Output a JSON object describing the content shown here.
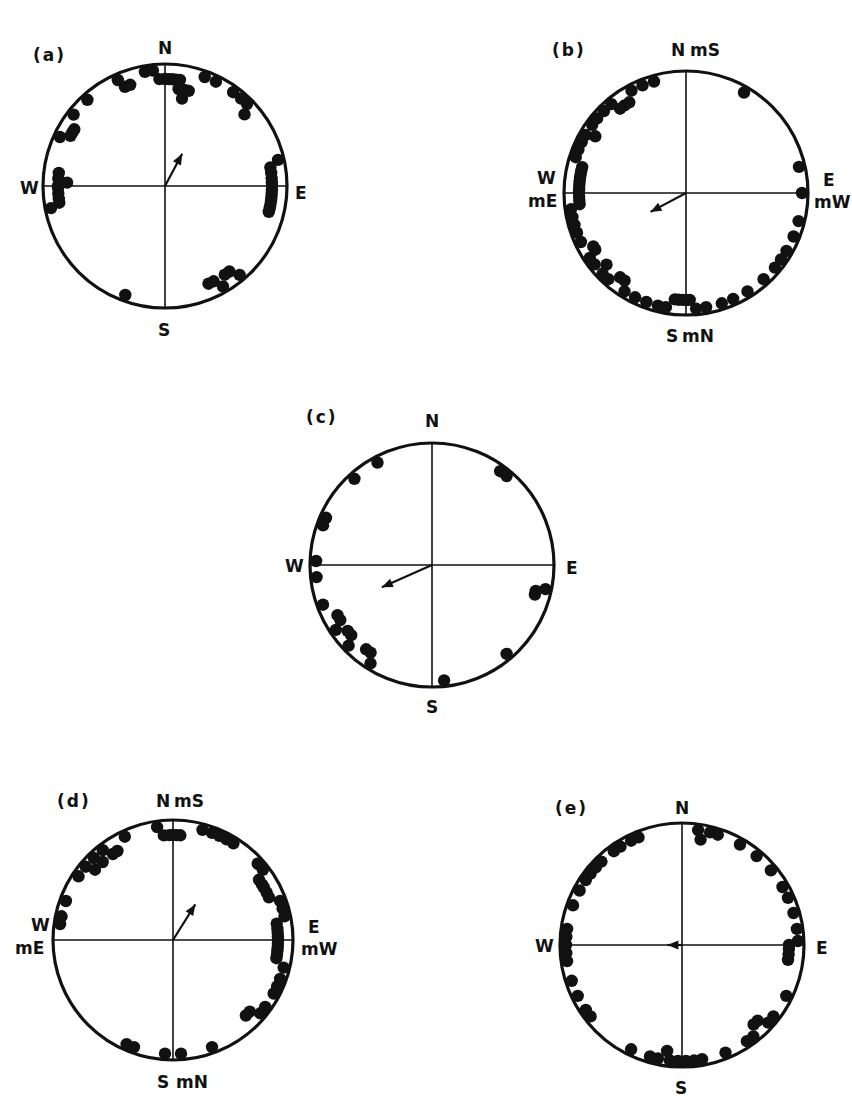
{
  "figure": {
    "panels": [
      {
        "id": "a",
        "label": "(a)",
        "north": "N",
        "south": "S",
        "west": "W",
        "east": "E",
        "north2": "",
        "south2": "",
        "west2": "",
        "east2": "",
        "center": [
          165,
          186
        ],
        "radius": 122,
        "label_pos": [
          33,
          47
        ],
        "mean_vector_deg": 28,
        "mean_vector_len": 0.3,
        "points_deg": [
          -10,
          -6,
          -3,
          0,
          2,
          4,
          6,
          8,
          8,
          10,
          11,
          12,
          14,
          20,
          26,
          36,
          41,
          45,
          48,
          77,
          80,
          83,
          86,
          88,
          90,
          92,
          94,
          96,
          98,
          100,
          102,
          104,
          140,
          143,
          146,
          150,
          153,
          156,
          200,
          259,
          261,
          263,
          266,
          269,
          270,
          272,
          274,
          277,
          295,
          298,
          300,
          302,
          308,
          318,
          336,
          338,
          341
        ]
      },
      {
        "id": "b",
        "label": "(b)",
        "north": "N",
        "south": "S",
        "west": "W",
        "east": "E",
        "north2": "mS",
        "south2": "mN",
        "west2": "mE",
        "east2": "mW",
        "center": [
          686,
          193
        ],
        "radius": 122,
        "label_pos": [
          552,
          42
        ],
        "mean_vector_deg": 242,
        "mean_vector_len": 0.33,
        "points_deg": [
          30,
          77,
          90,
          104,
          112,
          120,
          125,
          130,
          138,
          148,
          156,
          162,
          170,
          175,
          178,
          180,
          182,
          184,
          186,
          190,
          194,
          200,
          206,
          212,
          215,
          218,
          222,
          226,
          228,
          232,
          236,
          238,
          240,
          245,
          250,
          254,
          258,
          262,
          264,
          266,
          268,
          270,
          272,
          274,
          276,
          278,
          280,
          282,
          284,
          288,
          292,
          296,
          300,
          302,
          306,
          310,
          315,
          320,
          322,
          325,
          328,
          332,
          338,
          344
        ]
      },
      {
        "id": "c",
        "label": "(c)",
        "north": "N",
        "south": "S",
        "west": "W",
        "east": "E",
        "north2": "",
        "south2": "",
        "west2": "",
        "east2": "",
        "center": [
          432,
          565
        ],
        "radius": 122,
        "label_pos": [
          306,
          409
        ],
        "mean_vector_deg": 246,
        "mean_vector_len": 0.45,
        "points_deg": [
          36,
          40,
          102,
          104,
          106,
          140,
          174,
          212,
          215,
          218,
          226,
          229,
          232,
          236,
          239,
          242,
          250,
          264,
          272,
          290,
          294,
          318,
          332
        ]
      },
      {
        "id": "d",
        "label": "(d)",
        "north": "N",
        "south": "S",
        "west": "W",
        "east": "E",
        "north2": "mS",
        "south2": "mN",
        "west2": "mE",
        "east2": "mW",
        "center": [
          173,
          940
        ],
        "radius": 120,
        "label_pos": [
          57,
          793
        ],
        "mean_vector_deg": 32,
        "mean_vector_len": 0.35,
        "points_deg": [
          -8,
          -5,
          -2,
          0,
          2,
          4,
          15,
          20,
          24,
          28,
          32,
          48,
          52,
          55,
          58,
          60,
          63,
          66,
          70,
          74,
          78,
          81,
          84,
          86,
          88,
          90,
          92,
          94,
          96,
          98,
          100,
          104,
          110,
          114,
          118,
          126,
          130,
          133,
          136,
          160,
          176,
          184,
          200,
          204,
          278,
          282,
          290,
          304,
          310,
          312,
          316,
          318,
          322,
          325,
          328,
          335
        ]
      },
      {
        "id": "e",
        "label": "(e)",
        "north": "N",
        "south": "S",
        "west": "W",
        "east": "E",
        "north2": "",
        "south2": "",
        "west2": "",
        "east2": "",
        "center": [
          682,
          945
        ],
        "radius": 122,
        "label_pos": [
          555,
          800
        ],
        "mean_vector_deg": 270,
        "mean_vector_len": 0.12,
        "points_deg": [
          8,
          10,
          14,
          18,
          30,
          40,
          50,
          60,
          66,
          74,
          82,
          88,
          90,
          92,
          95,
          98,
          116,
          128,
          132,
          135,
          138,
          142,
          146,
          158,
          170,
          174,
          178,
          182,
          186,
          188,
          192,
          196,
          206,
          232,
          236,
          244,
          252,
          262,
          266,
          270,
          274,
          278,
          290,
          298,
          304,
          308,
          312,
          316,
          324,
          328,
          334,
          338
        ]
      }
    ]
  },
  "chart_data": {
    "type": "scatter",
    "title": "",
    "panels": [
      {
        "label": "(a)",
        "axes": {
          "top": "N",
          "bottom": "S",
          "left": "W",
          "right": "E"
        },
        "mean_direction_deg": 28,
        "n_points_approx": 57
      },
      {
        "label": "(b)",
        "axes": {
          "top": "N mS",
          "bottom": "S mN",
          "left": "W mE",
          "right": "E mW"
        },
        "mean_direction_deg": 242,
        "n_points_approx": 64
      },
      {
        "label": "(c)",
        "axes": {
          "top": "N",
          "bottom": "S",
          "left": "W",
          "right": "E"
        },
        "mean_direction_deg": 246,
        "n_points_approx": 23
      },
      {
        "label": "(d)",
        "axes": {
          "top": "N mS",
          "bottom": "S mN",
          "left": "W mE",
          "right": "E mW"
        },
        "mean_direction_deg": 32,
        "n_points_approx": 56
      },
      {
        "label": "(e)",
        "axes": {
          "top": "N",
          "bottom": "S",
          "left": "W",
          "right": "E"
        },
        "mean_direction_deg": 270,
        "n_points_approx": 52
      }
    ]
  },
  "style": {
    "ink": "#111111",
    "background": "#ffffff"
  }
}
